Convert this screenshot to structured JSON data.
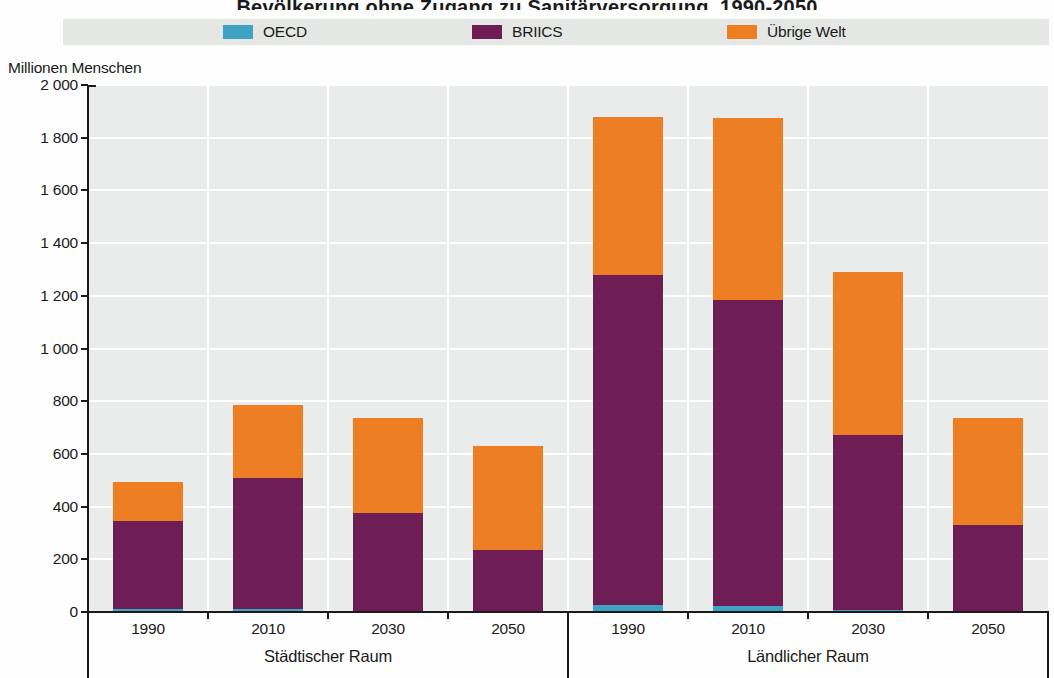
{
  "title_clipped": "Bevölkerung ohne Zugang zu Sanitärversorgung, 1990-2050",
  "legend": {
    "items": [
      {
        "label": "OECD",
        "color": "#3fa3c5"
      },
      {
        "label": "BRIICS",
        "color": "#6e1e55"
      },
      {
        "label": "Übrige Welt",
        "color": "#ee7e24"
      }
    ]
  },
  "y_axis": {
    "title": "Millionen Menschen",
    "tick_labels": [
      "2 000",
      "1 800",
      "1 600",
      "1 400",
      "1 200",
      "1 000",
      "800",
      "600",
      "400",
      "200",
      "0"
    ],
    "min": 0,
    "max": 2000,
    "step": 200
  },
  "x_axis": {
    "groups": [
      {
        "label": "Städtischer Raum",
        "years": [
          "1990",
          "2010",
          "2030",
          "2050"
        ]
      },
      {
        "label": "Ländlicher Raum",
        "years": [
          "1990",
          "2010",
          "2030",
          "2050"
        ]
      }
    ]
  },
  "chart_data": {
    "type": "bar",
    "stacked": true,
    "ylabel": "Millionen Menschen",
    "ylim": [
      0,
      2000
    ],
    "ytick_step": 200,
    "grid": true,
    "legend_position": "top",
    "group_labels": [
      "Städtischer Raum",
      "Ländlicher Raum"
    ],
    "group_spans": [
      4,
      4
    ],
    "categories": [
      "1990",
      "2010",
      "2030",
      "2050",
      "1990",
      "2010",
      "2030",
      "2050"
    ],
    "series": [
      {
        "name": "OECD",
        "color": "#3fa3c5",
        "values": [
          10,
          12,
          4,
          3,
          25,
          22,
          8,
          4
        ]
      },
      {
        "name": "BRIICS",
        "color": "#6e1e55",
        "values": [
          335,
          495,
          371,
          232,
          1255,
          1163,
          662,
          326
        ]
      },
      {
        "name": "Übrige Welt",
        "color": "#ee7e24",
        "values": [
          150,
          278,
          360,
          395,
          600,
          690,
          620,
          405
        ]
      }
    ],
    "totals": [
      495,
      785,
      735,
      630,
      1880,
      1875,
      1290,
      735
    ],
    "colors": {
      "plot_background": "#eaebeb",
      "gridline": "#ffffff",
      "axis": "#1a1a1a",
      "legend_band": "#e4e7e4"
    }
  }
}
